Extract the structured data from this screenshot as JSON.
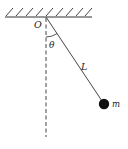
{
  "diagram": {
    "type": "simple pendulum",
    "labels": {
      "pivot": "O",
      "angle": "θ",
      "length": "L",
      "mass": "m"
    },
    "colors": {
      "stroke": "#333333",
      "bob": "#111111",
      "background": "#ffffff"
    }
  }
}
